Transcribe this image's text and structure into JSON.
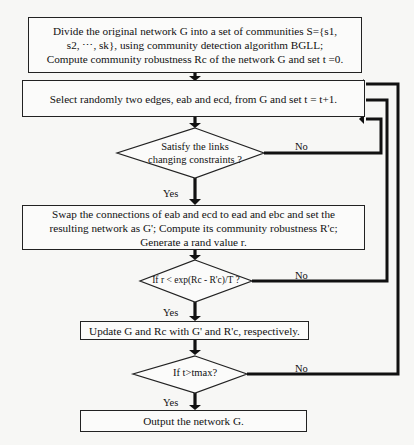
{
  "flowchart": {
    "start_box": {
      "lines": [
        "Divide the original network G into a set of communities S={s1,",
        "s2, ⋯, sk}, using  community detection algorithm BGLL;",
        "Compute community robustness Rc of the network G and set t =0."
      ]
    },
    "select_box": {
      "text": "Select randomly two edges, eab and ecd, from G and set t = t+1."
    },
    "decision_constraints": {
      "lines": [
        "Satisfy the links",
        "changing constraints ?"
      ],
      "no_label": "No",
      "yes_label": "Yes"
    },
    "swap_box": {
      "lines": [
        "Swap the connections of  eab  and ecd to ead and ebc and set the",
        "resulting network as G'; Compute its community robustness R'c;",
        "Generate a rand value r."
      ]
    },
    "decision_accept": {
      "text": "If r < exp(Rc - R'c)/T ?",
      "no_label": "No",
      "yes_label": "Yes"
    },
    "update_box": {
      "text": "Update G and Rc with G' and R'c, respectively."
    },
    "decision_tmax": {
      "text": "If t>tmax?",
      "no_label": "No",
      "yes_label": "Yes"
    },
    "output_box": {
      "text": "Output the network G."
    }
  }
}
